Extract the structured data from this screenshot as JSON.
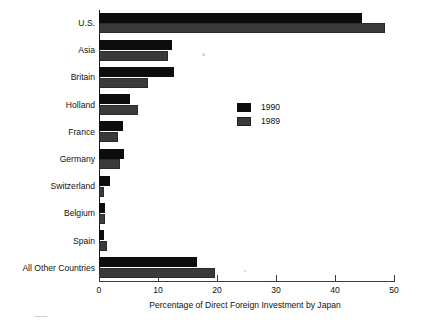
{
  "chart_data": {
    "type": "bar",
    "orientation": "horizontal",
    "title": "",
    "xlabel": "Percentage of Direct Foreign Investment by Japan",
    "ylabel": "",
    "xlim": [
      0,
      50
    ],
    "xticks": [
      0,
      10,
      20,
      30,
      40,
      50
    ],
    "grid": false,
    "legend_position": "center-right",
    "categories": [
      "U.S.",
      "Asia",
      "Britain",
      "Holland",
      "France",
      "Germany",
      "Switzerland",
      "Belgium",
      "Spain",
      "All Other Countries"
    ],
    "series": [
      {
        "name": "1990",
        "color": "#0d0d0d",
        "values": [
          44.5,
          12.4,
          12.7,
          5.3,
          4.0,
          4.2,
          1.8,
          1.0,
          0.8,
          16.6
        ]
      },
      {
        "name": "1989",
        "color": "#3a3a3a",
        "values": [
          48.5,
          11.7,
          8.3,
          6.6,
          3.2,
          3.6,
          0.8,
          1.0,
          1.3,
          19.7
        ]
      }
    ]
  },
  "legend": {
    "entries": [
      {
        "label": "1990",
        "swatch": "swatch-1990-icon"
      },
      {
        "label": "1989",
        "swatch": "swatch-1989-icon"
      }
    ]
  }
}
